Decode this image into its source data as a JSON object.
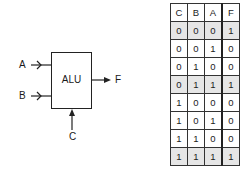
{
  "diagram": {
    "block_label": "ALU",
    "inputs": [
      {
        "name": "A",
        "side": "left"
      },
      {
        "name": "B",
        "side": "left"
      },
      {
        "name": "C",
        "side": "bottom"
      }
    ],
    "output": {
      "name": "F",
      "side": "right"
    }
  },
  "truth_table": {
    "headers": [
      "C",
      "B",
      "A",
      "F"
    ],
    "rows": [
      {
        "values": [
          "0",
          "0",
          "0",
          "1"
        ],
        "shaded": true
      },
      {
        "values": [
          "0",
          "0",
          "1",
          "0"
        ],
        "shaded": false
      },
      {
        "values": [
          "0",
          "1",
          "0",
          "0"
        ],
        "shaded": false
      },
      {
        "values": [
          "0",
          "1",
          "1",
          "1"
        ],
        "shaded": true
      },
      {
        "values": [
          "1",
          "0",
          "0",
          "0"
        ],
        "shaded": false
      },
      {
        "values": [
          "1",
          "0",
          "1",
          "0"
        ],
        "shaded": false
      },
      {
        "values": [
          "1",
          "1",
          "0",
          "0"
        ],
        "shaded": false
      },
      {
        "values": [
          "1",
          "1",
          "1",
          "1"
        ],
        "shaded": true
      }
    ]
  }
}
